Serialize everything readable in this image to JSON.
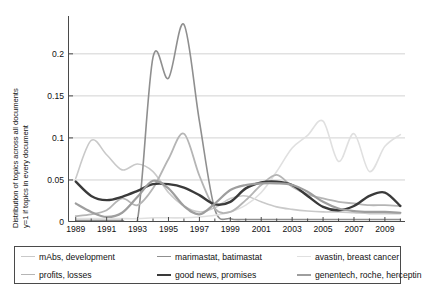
{
  "chart_data": {
    "type": "line",
    "title": "",
    "xlabel": "",
    "ylabel": "Distribution of topics across all documents y=1 if topics in every document",
    "ylabel_line1": "Distribution of topics across all documents",
    "ylabel_line2": "y=1 if topics in every document",
    "xlim": [
      1988.5,
      2010.3
    ],
    "ylim": [
      0,
      0.245
    ],
    "grid": true,
    "grid_axis": "y",
    "legend_position": "below",
    "yticks": [
      "0",
      "0.05",
      "0.1",
      "0.15",
      "0.2"
    ],
    "ytick_values": [
      0,
      0.05,
      0.1,
      0.15,
      0.2
    ],
    "xticks": [
      "1989",
      "1991",
      "1993",
      "1995",
      "1997",
      "1999",
      "2001",
      "2003",
      "2005",
      "2007",
      "2009"
    ],
    "xtick_values": [
      1989,
      1991,
      1993,
      1995,
      1997,
      1999,
      2001,
      2003,
      2005,
      2007,
      2009
    ],
    "xminor_values": [
      1990,
      1992,
      1994,
      1996,
      1998,
      2000,
      2002,
      2004,
      2006,
      2008,
      2010
    ],
    "x": [
      1989,
      1990,
      1991,
      1992,
      1993,
      1994,
      1995,
      1996,
      1997,
      1998,
      1999,
      2000,
      2001,
      2002,
      2003,
      2004,
      2005,
      2006,
      2007,
      2008,
      2009,
      2010
    ],
    "series": [
      {
        "name": "mAbs, development",
        "color": "#c9c9c9",
        "width": 1.6,
        "values": [
          0.052,
          0.097,
          0.08,
          0.062,
          0.069,
          0.06,
          0.035,
          0.019,
          0.012,
          0.017,
          0.028,
          0.031,
          0.024,
          0.018,
          0.015,
          0.013,
          0.012,
          0.012,
          0.011,
          0.01,
          0.01,
          0.01
        ]
      },
      {
        "name": "marimastat, batimastat",
        "color": "#8f8f8f",
        "width": 1.6,
        "values": [
          0.002,
          0.002,
          0.002,
          0.002,
          0.003,
          0.196,
          0.171,
          0.235,
          0.12,
          0.015,
          0.004,
          0.003,
          0.003,
          0.003,
          0.003,
          0.003,
          0.003,
          0.003,
          0.003,
          0.003,
          0.003,
          0.003
        ]
      },
      {
        "name": "avastin, breast cancer",
        "color": "#e0e0e0",
        "width": 1.6,
        "values": [
          0.004,
          0.004,
          0.004,
          0.004,
          0.004,
          0.005,
          0.005,
          0.005,
          0.006,
          0.008,
          0.012,
          0.02,
          0.035,
          0.06,
          0.088,
          0.103,
          0.12,
          0.072,
          0.105,
          0.06,
          0.09,
          0.104
        ]
      },
      {
        "name": "profits, losses",
        "color": "#b5b5b5",
        "width": 1.8,
        "values": [
          0.007,
          0.009,
          0.014,
          0.028,
          0.02,
          0.04,
          0.075,
          0.105,
          0.055,
          0.016,
          0.012,
          0.026,
          0.044,
          0.056,
          0.042,
          0.033,
          0.028,
          0.024,
          0.022,
          0.02,
          0.02,
          0.019
        ]
      },
      {
        "name": "good news, promises",
        "color": "#3a3a3a",
        "width": 2.4,
        "values": [
          0.048,
          0.031,
          0.026,
          0.03,
          0.037,
          0.045,
          0.045,
          0.041,
          0.032,
          0.021,
          0.024,
          0.04,
          0.047,
          0.048,
          0.044,
          0.031,
          0.018,
          0.014,
          0.019,
          0.031,
          0.035,
          0.019
        ]
      },
      {
        "name": "genentech, roche, herceptin",
        "color": "#9e9e9e",
        "width": 2.2,
        "values": [
          0.022,
          0.012,
          0.006,
          0.011,
          0.03,
          0.049,
          0.04,
          0.019,
          0.009,
          0.022,
          0.038,
          0.044,
          0.046,
          0.046,
          0.044,
          0.036,
          0.024,
          0.016,
          0.013,
          0.012,
          0.012,
          0.011
        ]
      }
    ]
  },
  "legend": {
    "rows": [
      [
        {
          "label": "mAbs, development"
        },
        {
          "label": "marimastat, batimastat"
        },
        {
          "label": "avastin, breast cancer"
        }
      ],
      [
        {
          "label": "profits, losses"
        },
        {
          "label": "good news, promises"
        },
        {
          "label": "genentech, roche, herceptin"
        }
      ]
    ]
  },
  "style": {
    "axis_color": "#4a4a4a",
    "grid_color": "#d2d2d2",
    "background": "#ffffff",
    "text_color": "#111111"
  }
}
